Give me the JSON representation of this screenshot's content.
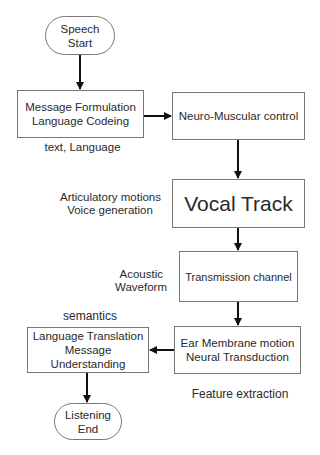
{
  "diagram": {
    "nodes": {
      "start": {
        "line1": "Speech",
        "line2": "Start"
      },
      "message_formulation": {
        "line1": "Message Formulation",
        "line2": "Language Codeing"
      },
      "neuro_muscular": {
        "line1": "Neuro-Muscular control"
      },
      "vocal_track": {
        "line1": "Vocal Track"
      },
      "transmission": {
        "line1": "Transmission channel"
      },
      "ear_membrane": {
        "line1": "Ear Membrane motion",
        "line2": "Neural Transduction"
      },
      "language_translation": {
        "line1": "Language Translation",
        "line2": "Message Understanding"
      },
      "end": {
        "line1": "Listening",
        "line2": "End"
      }
    },
    "annotations": {
      "text_language": "text, Language",
      "articulatory_1": "Articulatory motions",
      "articulatory_2": "Voice generation",
      "acoustic_1": "Acoustic",
      "acoustic_2": "Waveform",
      "semantics": "semantics",
      "feature_extraction": "Feature extraction"
    },
    "colors": {
      "line": "#111111",
      "border": "#777777",
      "text": "#2a2a2a"
    }
  }
}
